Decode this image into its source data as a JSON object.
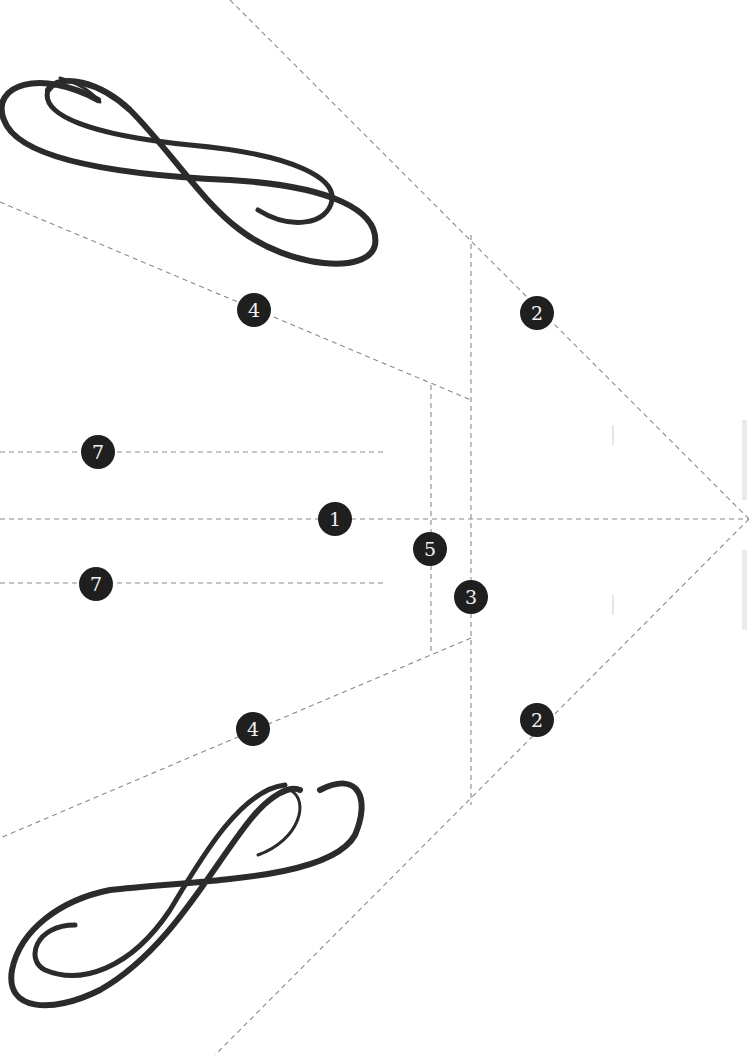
{
  "diagram": {
    "type": "fold-cut template",
    "background": "#ffffff",
    "line_color": "#8a8a8a",
    "marker_color": "#1f1f1f",
    "marker_text_color": "#f2f2f2",
    "markers": [
      {
        "id": "m1",
        "label": "1",
        "x": 335,
        "y": 519
      },
      {
        "id": "m2a",
        "label": "2",
        "x": 537,
        "y": 313
      },
      {
        "id": "m2b",
        "label": "2",
        "x": 537,
        "y": 720
      },
      {
        "id": "m3",
        "label": "3",
        "x": 471,
        "y": 597
      },
      {
        "id": "m4a",
        "label": "4",
        "x": 254,
        "y": 310
      },
      {
        "id": "m4b",
        "label": "4",
        "x": 253,
        "y": 729
      },
      {
        "id": "m5",
        "label": "5",
        "x": 430,
        "y": 549
      },
      {
        "id": "m7a",
        "label": "7",
        "x": 98,
        "y": 452
      },
      {
        "id": "m7b",
        "label": "7",
        "x": 96,
        "y": 584
      }
    ]
  }
}
